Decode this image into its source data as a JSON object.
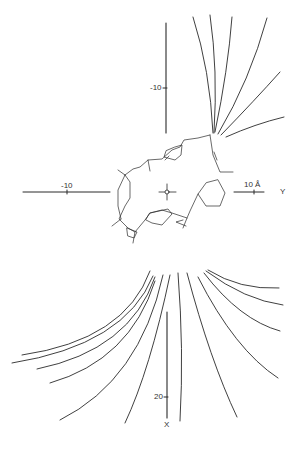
{
  "figure": {
    "background": "#ffffff",
    "line_color": "#2a2a2a",
    "axes": {
      "x_axis": {
        "name": "X",
        "tick_labels": [
          "-10",
          "20"
        ],
        "direction": "vertical (down)"
      },
      "y_axis": {
        "name": "Y",
        "tick_labels": [
          "-10",
          "10 Å"
        ],
        "direction": "horizontal (right)"
      },
      "unit": "Å"
    },
    "labels": {
      "x_neg10": "-10",
      "x_20": "20",
      "x_name": "X",
      "y_neg10": "-10",
      "y_10": "10 Å",
      "y_name": "Y"
    },
    "center_marker": "origin-crosshair",
    "molecule": "cyclic ring structure with pentagon rings (stick model)",
    "trajectories": {
      "upper_bundle_count": 6,
      "lower_bundle_count": 14
    }
  }
}
